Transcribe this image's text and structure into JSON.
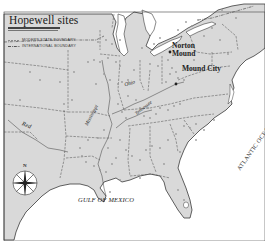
{
  "title": "Hopewell sites",
  "legend": {
    "items": [
      {
        "label": "MODERN STATE BOUNDARY",
        "style": "dashed"
      },
      {
        "label": "INTERNATIONAL BOUNDARY",
        "style": "dash-dot"
      }
    ]
  },
  "labels": {
    "norton_line1": "Norton",
    "norton_line2": "Mound",
    "mound_city": "Mound City",
    "ohio": "Ohio",
    "mississippi": "Mississippi",
    "tennessee": "Tennessee",
    "red": "Red",
    "atlantic": "ATLANTIC OCEAN",
    "gulf": "GULF OF MEXICO",
    "compass_n": "N"
  },
  "colors": {
    "land": "#d9d9d9",
    "water": "#ffffff",
    "outline": "#3a3a3a",
    "boundary": "#555555",
    "site": "#9a9a9a"
  },
  "sites": [
    [
      20,
      100
    ],
    [
      60,
      82
    ],
    [
      74,
      72
    ],
    [
      88,
      62
    ],
    [
      94,
      60
    ],
    [
      100,
      62
    ],
    [
      108,
      58
    ],
    [
      116,
      62
    ],
    [
      120,
      66
    ],
    [
      104,
      74
    ],
    [
      110,
      80
    ],
    [
      96,
      84
    ],
    [
      118,
      84
    ],
    [
      122,
      82
    ],
    [
      128,
      80
    ],
    [
      112,
      44
    ],
    [
      120,
      40
    ],
    [
      98,
      42
    ],
    [
      106,
      40
    ],
    [
      142,
      48
    ],
    [
      154,
      44
    ],
    [
      160,
      38
    ],
    [
      178,
      30
    ],
    [
      186,
      22
    ],
    [
      192,
      26
    ],
    [
      198,
      20
    ],
    [
      168,
      60
    ],
    [
      172,
      68
    ],
    [
      176,
      72
    ],
    [
      170,
      74
    ],
    [
      178,
      78
    ],
    [
      184,
      80
    ],
    [
      166,
      82
    ],
    [
      188,
      68
    ],
    [
      194,
      60
    ],
    [
      212,
      28
    ],
    [
      204,
      36
    ],
    [
      220,
      40
    ],
    [
      228,
      54
    ],
    [
      236,
      18
    ],
    [
      222,
      10
    ],
    [
      150,
      64
    ],
    [
      158,
      66
    ],
    [
      134,
      70
    ],
    [
      128,
      96
    ],
    [
      136,
      100
    ],
    [
      140,
      108
    ],
    [
      144,
      116
    ],
    [
      150,
      118
    ],
    [
      156,
      114
    ],
    [
      148,
      108
    ],
    [
      160,
      108
    ],
    [
      168,
      110
    ],
    [
      174,
      106
    ],
    [
      180,
      104
    ],
    [
      118,
      104
    ],
    [
      122,
      112
    ],
    [
      126,
      118
    ],
    [
      104,
      130
    ],
    [
      98,
      138
    ],
    [
      88,
      140
    ],
    [
      80,
      148
    ],
    [
      82,
      156
    ],
    [
      86,
      162
    ],
    [
      94,
      166
    ],
    [
      100,
      170
    ],
    [
      106,
      172
    ],
    [
      112,
      164
    ],
    [
      116,
      158
    ],
    [
      108,
      148
    ],
    [
      120,
      140
    ],
    [
      126,
      150
    ],
    [
      132,
      156
    ],
    [
      140,
      160
    ],
    [
      146,
      150
    ],
    [
      152,
      146
    ],
    [
      160,
      148
    ],
    [
      168,
      140
    ],
    [
      176,
      134
    ],
    [
      184,
      126
    ],
    [
      190,
      128
    ],
    [
      196,
      124
    ],
    [
      204,
      130
    ],
    [
      214,
      120
    ],
    [
      196,
      140
    ],
    [
      180,
      152
    ],
    [
      164,
      164
    ],
    [
      140,
      178
    ],
    [
      120,
      180
    ],
    [
      110,
      192
    ],
    [
      178,
      190
    ],
    [
      184,
      200
    ],
    [
      64,
      104
    ],
    [
      72,
      100
    ],
    [
      40,
      80
    ],
    [
      30,
      72
    ]
  ]
}
